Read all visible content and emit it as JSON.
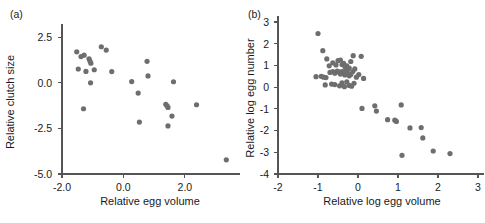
{
  "figure": {
    "background_color": "#ffffff",
    "point_color": "#6e6e6e",
    "axis_color": "#555555",
    "text_color": "#1a1a1a"
  },
  "panels": [
    {
      "id": "a",
      "label": "(a)"
    },
    {
      "id": "b",
      "label": "(b)"
    }
  ],
  "chart_data": [
    {
      "type": "scatter",
      "panel": "(a)",
      "title": "",
      "xlabel": "Relative egg volume",
      "ylabel": "Relative clutch size",
      "xlim": [
        -2.0,
        3.6
      ],
      "ylim": [
        -5.0,
        2.9
      ],
      "xticks": [
        -2.0,
        0.0,
        2.0
      ],
      "xticklabels": [
        "-2.0",
        "0.0",
        "2.0"
      ],
      "yticks": [
        2.5,
        0.0,
        -2.5,
        -5.0
      ],
      "yticklabels": [
        "2.5",
        "0.0",
        "-2.5",
        "-5.0"
      ],
      "grid": false,
      "legend": false,
      "n_points": 27,
      "points": [
        [
          -1.52,
          1.7
        ],
        [
          -1.38,
          1.44
        ],
        [
          -1.47,
          0.76
        ],
        [
          -1.28,
          1.52
        ],
        [
          -1.12,
          1.32
        ],
        [
          -1.09,
          1.2
        ],
        [
          -1.06,
          1.08
        ],
        [
          -1.22,
          0.63
        ],
        [
          -1.07,
          0.0
        ],
        [
          -0.95,
          0.72
        ],
        [
          -0.72,
          1.98
        ],
        [
          -0.56,
          1.8
        ],
        [
          -0.38,
          0.62
        ],
        [
          -1.3,
          -1.42
        ],
        [
          0.27,
          0.07
        ],
        [
          0.48,
          -0.56
        ],
        [
          0.52,
          -2.15
        ],
        [
          0.77,
          1.18
        ],
        [
          0.8,
          0.38
        ],
        [
          1.38,
          -1.18
        ],
        [
          1.42,
          -1.26
        ],
        [
          1.45,
          -1.35
        ],
        [
          1.45,
          -2.36
        ],
        [
          1.58,
          -1.82
        ],
        [
          1.63,
          0.06
        ],
        [
          2.38,
          -1.2
        ],
        [
          3.35,
          -4.22
        ]
      ]
    },
    {
      "type": "scatter",
      "panel": "(b)",
      "title": "",
      "xlabel": "Relative log egg volume",
      "ylabel": "Relative log egg number",
      "xlim": [
        -2,
        3
      ],
      "ylim": [
        -4,
        3
      ],
      "xticks": [
        -2,
        -1,
        0,
        1,
        2,
        3
      ],
      "xticklabels": [
        "-2",
        "-1",
        "0",
        "1",
        "2",
        "3"
      ],
      "yticks": [
        3,
        2,
        1,
        0,
        -1,
        -2,
        -3,
        -4
      ],
      "yticklabels": [
        "3",
        "2",
        "1",
        "0",
        "-1",
        "-2",
        "-3",
        "-4"
      ],
      "grid": false,
      "legend": false,
      "n_points": 58,
      "points": [
        [
          -1.0,
          2.47
        ],
        [
          -0.88,
          1.68
        ],
        [
          -0.78,
          1.3
        ],
        [
          -0.72,
          0.98
        ],
        [
          -0.63,
          1.12
        ],
        [
          -0.55,
          1.02
        ],
        [
          -0.5,
          1.22
        ],
        [
          -0.44,
          1.25
        ],
        [
          -0.4,
          1.04
        ],
        [
          -0.36,
          1.1
        ],
        [
          -0.32,
          0.92
        ],
        [
          -0.28,
          0.98
        ],
        [
          -0.26,
          0.8
        ],
        [
          -0.22,
          0.88
        ],
        [
          -0.18,
          1.18
        ],
        [
          -0.12,
          1.45
        ],
        [
          0.08,
          1.42
        ],
        [
          -1.05,
          0.48
        ],
        [
          -0.92,
          0.5
        ],
        [
          -0.86,
          0.46
        ],
        [
          -0.8,
          0.44
        ],
        [
          -0.7,
          0.68
        ],
        [
          -0.63,
          0.72
        ],
        [
          -0.58,
          0.64
        ],
        [
          -0.52,
          0.74
        ],
        [
          -0.48,
          0.7
        ],
        [
          -0.44,
          0.6
        ],
        [
          -0.4,
          0.72
        ],
        [
          -0.36,
          0.66
        ],
        [
          -0.33,
          0.56
        ],
        [
          -0.3,
          0.78
        ],
        [
          -0.26,
          0.62
        ],
        [
          -0.22,
          0.52
        ],
        [
          -0.18,
          0.58
        ],
        [
          -0.13,
          0.72
        ],
        [
          -0.08,
          0.84
        ],
        [
          -0.04,
          0.46
        ],
        [
          0.02,
          0.58
        ],
        [
          0.14,
          0.4
        ],
        [
          -0.82,
          0.1
        ],
        [
          -0.66,
          0.14
        ],
        [
          -0.58,
          0.12
        ],
        [
          -0.46,
          0.06
        ],
        [
          -0.4,
          0.2
        ],
        [
          -0.34,
          0.02
        ],
        [
          -0.28,
          0.24
        ],
        [
          -0.22,
          0.08
        ],
        [
          -0.16,
          0.04
        ],
        [
          -0.1,
          0.18
        ],
        [
          0.1,
          -0.98
        ],
        [
          0.42,
          -0.86
        ],
        [
          0.46,
          -1.1
        ],
        [
          0.74,
          -1.5
        ],
        [
          0.92,
          -1.52
        ],
        [
          0.96,
          -1.58
        ],
        [
          1.08,
          -0.82
        ],
        [
          1.1,
          -3.14
        ],
        [
          1.3,
          -1.88
        ],
        [
          1.58,
          -1.86
        ],
        [
          1.62,
          -2.34
        ],
        [
          1.88,
          -2.94
        ],
        [
          2.3,
          -3.06
        ]
      ]
    }
  ]
}
